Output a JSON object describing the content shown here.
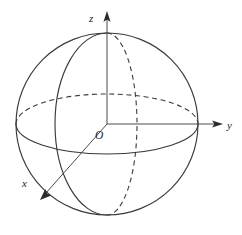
{
  "figure": {
    "kind": "3d-sphere-axes-diagram",
    "background_color": "#ffffff",
    "stroke_color": "#3a3a3a",
    "axis_color": "#4a4a4a",
    "label_color": "#1d1d1d",
    "width": 242,
    "height": 235
  },
  "labels": {
    "z_axis": "z",
    "y_axis": "y",
    "x_axis": "x",
    "origin": "O"
  },
  "geometry": {
    "center": {
      "x": 107,
      "y": 124
    },
    "sphere_radius": 91,
    "equator": {
      "rx": 91,
      "ry": 30,
      "back_half": "dashed",
      "front_half": "solid"
    },
    "meridian_solid": {
      "rx": 52,
      "ry": 91,
      "side": "left",
      "style": "solid"
    },
    "meridian_dashed": {
      "rx": 30,
      "ry": 91,
      "side": "right",
      "style": "dashed"
    },
    "z_axis_tip": {
      "x": 107,
      "y": 13
    },
    "y_axis_tip": {
      "x": 222,
      "y": 124
    },
    "x_axis_tip": {
      "x": 42,
      "y": 198
    }
  }
}
